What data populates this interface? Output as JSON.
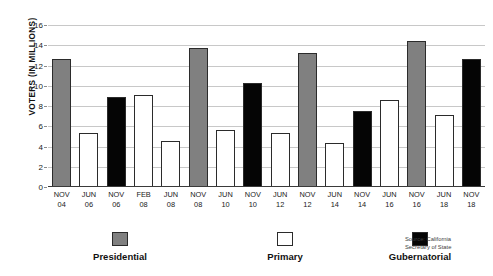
{
  "chart_data": {
    "type": "bar",
    "title": "",
    "xlabel": "",
    "ylabel": "VOTERS (IN MILLIONS)",
    "ylim": [
      0,
      16
    ],
    "ytick_step": 2,
    "yticks": [
      0,
      2,
      4,
      6,
      8,
      10,
      12,
      14,
      16
    ],
    "ytick_labels": [
      "0",
      "2",
      "4",
      "6",
      "8",
      "10",
      "12",
      "14",
      "16"
    ],
    "grid": true,
    "grid_axis": "y",
    "legend_position": "bottom",
    "categories": [
      "NOV 04",
      "JUN 06",
      "NOV 06",
      "FEB 08",
      "JUN 08",
      "NOV 08",
      "JUN 10",
      "NOV 10",
      "JUN 12",
      "NOV 12",
      "JUN 14",
      "NOV 14",
      "JUN 16",
      "NOV 16",
      "JUN 18",
      "NOV 18"
    ],
    "category_lines": [
      {
        "line1": "NOV",
        "line2": "04"
      },
      {
        "line1": "JUN",
        "line2": "06"
      },
      {
        "line1": "NOV",
        "line2": "06"
      },
      {
        "line1": "FEB",
        "line2": "08"
      },
      {
        "line1": "JUN",
        "line2": "08"
      },
      {
        "line1": "NOV",
        "line2": "08"
      },
      {
        "line1": "JUN",
        "line2": "10"
      },
      {
        "line1": "NOV",
        "line2": "10"
      },
      {
        "line1": "JUN",
        "line2": "12"
      },
      {
        "line1": "NOV",
        "line2": "12"
      },
      {
        "line1": "JUN",
        "line2": "14"
      },
      {
        "line1": "NOV",
        "line2": "14"
      },
      {
        "line1": "JUN",
        "line2": "16"
      },
      {
        "line1": "NOV",
        "line2": "16"
      },
      {
        "line1": "JUN",
        "line2": "18"
      },
      {
        "line1": "NOV",
        "line2": "18"
      }
    ],
    "values": [
      12.6,
      5.3,
      8.9,
      9.1,
      4.5,
      13.75,
      5.65,
      10.25,
      5.3,
      13.2,
      4.35,
      7.5,
      8.55,
      14.4,
      7.1,
      12.6
    ],
    "bar_types": [
      "presidential",
      "primary",
      "gubernatorial",
      "primary",
      "primary",
      "presidential",
      "primary",
      "gubernatorial",
      "primary",
      "presidential",
      "primary",
      "gubernatorial",
      "primary",
      "presidential",
      "primary",
      "gubernatorial"
    ],
    "series": [
      {
        "name": "Presidential",
        "key": "presidential",
        "color": "#808080",
        "points": [
          {
            "category": "NOV 04",
            "value": 12.6
          },
          {
            "category": "NOV 08",
            "value": 13.75
          },
          {
            "category": "NOV 12",
            "value": 13.2
          },
          {
            "category": "NOV 16",
            "value": 14.4
          }
        ]
      },
      {
        "name": "Primary",
        "key": "primary",
        "color": "#ffffff",
        "points": [
          {
            "category": "JUN 06",
            "value": 5.3
          },
          {
            "category": "FEB 08",
            "value": 9.1
          },
          {
            "category": "JUN 08",
            "value": 4.5
          },
          {
            "category": "JUN 10",
            "value": 5.65
          },
          {
            "category": "JUN 12",
            "value": 5.3
          },
          {
            "category": "JUN 14",
            "value": 4.35
          },
          {
            "category": "JUN 16",
            "value": 8.55
          },
          {
            "category": "JUN 18",
            "value": 7.1
          }
        ]
      },
      {
        "name": "Gubernatorial",
        "key": "gubernatorial",
        "color": "#050505",
        "points": [
          {
            "category": "NOV 06",
            "value": 8.9
          },
          {
            "category": "NOV 10",
            "value": 10.25
          },
          {
            "category": "NOV 14",
            "value": 7.5
          },
          {
            "category": "NOV 18",
            "value": 12.6
          }
        ]
      }
    ],
    "legend": [
      {
        "label": "Presidential",
        "key": "presidential",
        "color": "#808080"
      },
      {
        "label": "Primary",
        "key": "primary",
        "color": "#ffffff"
      },
      {
        "label": "Gubernatorial",
        "key": "gubernatorial",
        "color": "#050505"
      }
    ],
    "source": {
      "line1": "Source: California",
      "line2": "Secretary of State"
    },
    "colors": {
      "presidential": "#808080",
      "primary": "#ffffff",
      "gubernatorial": "#050505",
      "bar_outline": "#2b2b2b",
      "gridline": "#c8c8c8",
      "axis": "#3a3a3a",
      "text": "#1a1a1a"
    }
  }
}
